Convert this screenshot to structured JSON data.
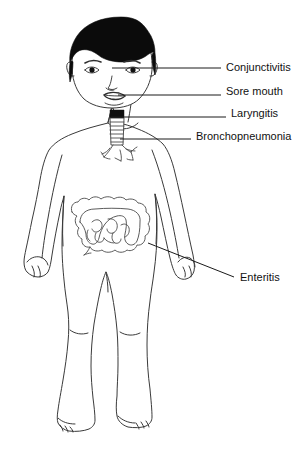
{
  "figure": {
    "background_color": "#ffffff",
    "line_color": "#3a3a3a",
    "hair_color": "#0b0b0b",
    "width": 302,
    "height": 453
  },
  "labels": [
    {
      "id": "conjunctivitis",
      "text": "Conjunctivitis",
      "x": 226,
      "y": 62,
      "leader_from_x": 112,
      "leader_from_y": 68,
      "leader_to_x": 221,
      "leader_to_y": 68
    },
    {
      "id": "sore-mouth",
      "text": "Sore mouth",
      "x": 226,
      "y": 86,
      "leader_from_x": 118,
      "leader_from_y": 95,
      "leader_to_x": 221,
      "leader_to_y": 95
    },
    {
      "id": "laryngitis",
      "text": "Laryngitis",
      "x": 231,
      "y": 108,
      "leader_from_x": 111,
      "leader_from_y": 117,
      "leader_to_x": 226,
      "leader_to_y": 117
    },
    {
      "id": "bronchopneumonia",
      "text": "Bronchopneumonia",
      "x": 196,
      "y": 131,
      "leader_from_x": 120,
      "leader_from_y": 139,
      "leader_to_x": 191,
      "leader_to_y": 139
    },
    {
      "id": "enteritis",
      "text": "Enteritis",
      "x": 240,
      "y": 272,
      "leader_from_x": 148,
      "leader_from_y": 243,
      "leader_to_x": 234,
      "leader_to_y": 277
    }
  ],
  "anatomy": {
    "organs": [
      {
        "id": "trachea",
        "name": "trachea"
      },
      {
        "id": "bronchi",
        "name": "bronchi"
      },
      {
        "id": "large-intestine",
        "name": "large intestine"
      },
      {
        "id": "small-intestine",
        "name": "small intestine"
      }
    ],
    "features": [
      {
        "id": "hair",
        "name": "hair"
      },
      {
        "id": "eyes",
        "name": "eyes"
      },
      {
        "id": "nose",
        "name": "nose"
      },
      {
        "id": "mouth",
        "name": "mouth"
      },
      {
        "id": "arms",
        "name": "arms"
      },
      {
        "id": "hands",
        "name": "hands"
      },
      {
        "id": "legs",
        "name": "legs"
      },
      {
        "id": "feet",
        "name": "feet"
      }
    ]
  }
}
